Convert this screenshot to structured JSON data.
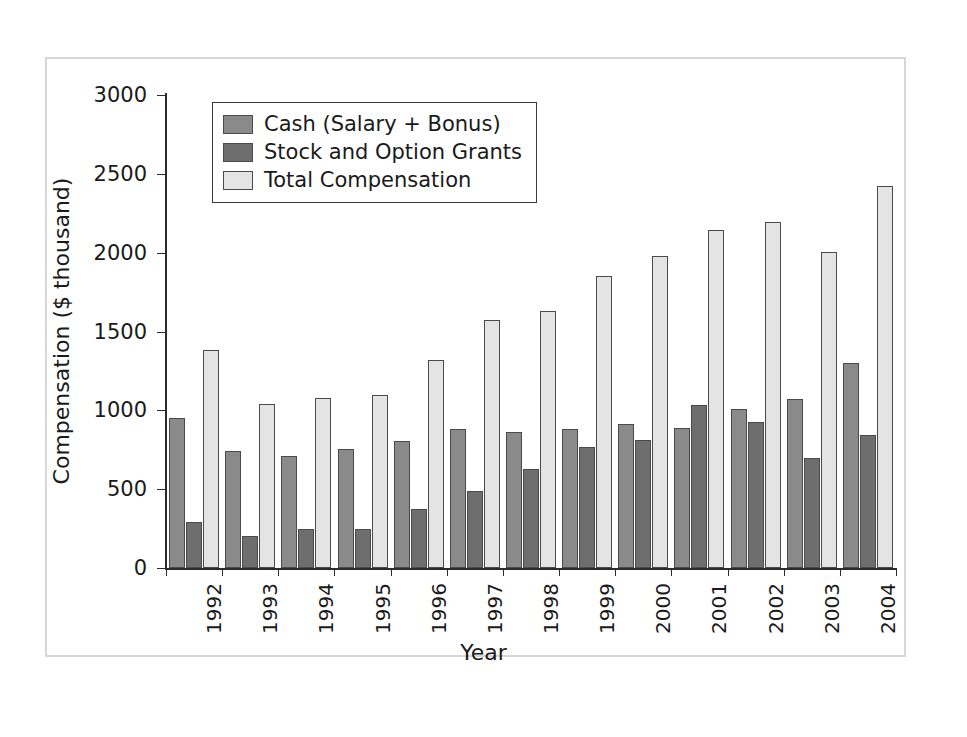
{
  "chart_data": {
    "type": "bar",
    "title": "",
    "xlabel": "Year",
    "ylabel": "Compensation ($ thousand)",
    "ylim": [
      0,
      3000
    ],
    "yticks": [
      0,
      500,
      1000,
      1500,
      2000,
      2500,
      3000
    ],
    "ytick_labels": [
      "0",
      "500",
      "1000",
      "1500",
      "2000",
      "2500",
      "3000"
    ],
    "grid": false,
    "legend_position": "upper left",
    "categories": [
      "1992",
      "1993",
      "1994",
      "1995",
      "1996",
      "1997",
      "1998",
      "1999",
      "2000",
      "2001",
      "2002",
      "2003",
      "2004"
    ],
    "series": [
      {
        "name": "Cash (Salary + Bonus)",
        "color": "#8a8a8a",
        "values": [
          950,
          740,
          710,
          755,
          805,
          880,
          865,
          880,
          915,
          890,
          1010,
          1075,
          1300
        ]
      },
      {
        "name": "Stock and Option Grants",
        "color": "#6e6e6e",
        "values": [
          295,
          205,
          245,
          250,
          375,
          490,
          630,
          770,
          815,
          1035,
          925,
          700,
          845
        ]
      },
      {
        "name": "Total Compensation",
        "color": "#e4e4e4",
        "values": [
          1380,
          1040,
          1080,
          1100,
          1320,
          1575,
          1630,
          1850,
          1980,
          2145,
          2195,
          2005,
          2425
        ]
      }
    ]
  },
  "legend": {
    "items": [
      {
        "label": "Cash (Salary + Bonus)"
      },
      {
        "label": "Stock and Option Grants"
      },
      {
        "label": "Total Compensation"
      }
    ]
  }
}
